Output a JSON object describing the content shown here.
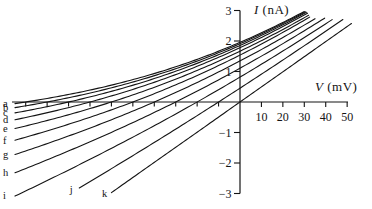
{
  "figure": {
    "background": "#ffffff",
    "ink_color": "#141414"
  },
  "chart_data": {
    "type": "line",
    "title": "",
    "xlabel": "V (mV)",
    "ylabel": "I (nA)",
    "grid": false,
    "legend_position": "none (curves labeled a–k at their lower-left ends)",
    "x_axis": {
      "symbol": "V",
      "unit_label": "(mV)",
      "unit": "mV",
      "range": [
        -108,
        52
      ],
      "labeled_ticks": [
        {
          "value": 10,
          "label": "10"
        },
        {
          "value": 20,
          "label": "20"
        },
        {
          "value": 30,
          "label": "30"
        },
        {
          "value": 40,
          "label": "40"
        },
        {
          "value": 50,
          "label": "50"
        }
      ],
      "unlabeled_tick_values": [
        -100,
        -90,
        -80,
        -70,
        -60,
        -50,
        -40,
        -30,
        -20,
        -10
      ]
    },
    "y_axis": {
      "symbol": "I",
      "unit_label": "(nA)",
      "unit": "nA",
      "range": [
        -3,
        3
      ],
      "ticks": [
        {
          "value": 3,
          "label": "3"
        },
        {
          "value": 2,
          "label": "2"
        },
        {
          "value": 1,
          "label": "1"
        },
        {
          "value": -1,
          "label": "−1"
        },
        {
          "value": -2,
          "label": "−2"
        },
        {
          "value": -3,
          "label": "−3"
        }
      ]
    },
    "model": {
      "type": "GHK-like rectifying I–V family",
      "formula": "I(V) = gain * g * V * (1 - exp((Vrev - V)/vt)) / (1 - exp(-V/vt)); at V=0: I = gain * g * vt * (1 - exp(Vrev/vt))",
      "g_nA_per_mV": 0.055,
      "vt_mV": 37
    },
    "series": [
      {
        "label": "a",
        "reversal_mV": -100,
        "v_min_mV": -105,
        "v_max_mV": 30.0,
        "gain": 1.03,
        "anchor_points_mV_nA": [
          [
            -105,
            -0.05
          ],
          [
            -100,
            0
          ],
          [
            0,
            1.96
          ],
          [
            30,
            2.97
          ]
        ]
      },
      {
        "label": "b",
        "reversal_mV": -90,
        "v_min_mV": -105,
        "v_max_mV": 30.5,
        "gain": 1.03,
        "anchor_points_mV_nA": [
          [
            -105,
            -0.18
          ],
          [
            -90,
            0
          ],
          [
            0,
            1.91
          ],
          [
            30.5,
            2.96
          ]
        ]
      },
      {
        "label": "c",
        "reversal_mV": -80,
        "v_min_mV": -105,
        "v_max_mV": 31.0,
        "gain": 1.03,
        "anchor_points_mV_nA": [
          [
            -105,
            -0.34
          ],
          [
            -80,
            0
          ],
          [
            0,
            1.86
          ],
          [
            31,
            2.94
          ]
        ]
      },
      {
        "label": "d",
        "reversal_mV": -70,
        "v_min_mV": -105,
        "v_max_mV": 31.5,
        "gain": 1.03,
        "anchor_points_mV_nA": [
          [
            -105,
            -0.56
          ],
          [
            -70,
            0
          ],
          [
            0,
            1.78
          ],
          [
            31.5,
            2.91
          ]
        ]
      },
      {
        "label": "e",
        "reversal_mV": -60,
        "v_min_mV": -105,
        "v_max_mV": 32.0,
        "gain": 1.02,
        "anchor_points_mV_nA": [
          [
            -105,
            -0.84
          ],
          [
            -60,
            0
          ],
          [
            0,
            1.67
          ],
          [
            32,
            2.84
          ]
        ]
      },
      {
        "label": "f",
        "reversal_mV": -50,
        "v_min_mV": -105,
        "v_max_mV": 32.5,
        "gain": 1.02,
        "anchor_points_mV_nA": [
          [
            -105,
            -1.21
          ],
          [
            -50,
            0
          ],
          [
            0,
            1.54
          ],
          [
            32.5,
            2.78
          ]
        ]
      },
      {
        "label": "g",
        "reversal_mV": -40,
        "v_min_mV": -105,
        "v_max_mV": 35.0,
        "gain": 1.0,
        "anchor_points_mV_nA": [
          [
            -105,
            -1.66
          ],
          [
            -40,
            0
          ],
          [
            0,
            1.35
          ],
          [
            35,
            2.73
          ]
        ]
      },
      {
        "label": "h",
        "reversal_mV": -30,
        "v_min_mV": -105,
        "v_max_mV": 39.5,
        "gain": 0.98,
        "anchor_points_mV_nA": [
          [
            -105,
            -2.23
          ],
          [
            -30,
            0
          ],
          [
            0,
            1.11
          ],
          [
            39.5,
            2.74
          ]
        ]
      },
      {
        "label": "i",
        "reversal_mV": -20,
        "v_min_mV": -105,
        "v_max_mV": 43.0,
        "gain": 0.96,
        "anchor_points_mV_nA": [
          [
            -105,
            -2.97
          ],
          [
            -20,
            0
          ],
          [
            0,
            0.82
          ],
          [
            43,
            2.7
          ]
        ]
      },
      {
        "label": "j",
        "reversal_mV": -10,
        "v_min_mV": -75,
        "v_max_mV": 48.0,
        "gain": 0.94,
        "anchor_points_mV_nA": [
          [
            -75,
            -2.81
          ],
          [
            -10,
            0
          ],
          [
            0,
            0.45
          ],
          [
            48,
            2.7
          ]
        ]
      },
      {
        "label": "k",
        "reversal_mV": 0,
        "v_min_mV": -60,
        "v_max_mV": 52.0,
        "gain": 0.9,
        "anchor_points_mV_nA": [
          [
            -60,
            -2.97
          ],
          [
            0,
            0
          ],
          [
            52,
            2.57
          ]
        ]
      }
    ]
  }
}
